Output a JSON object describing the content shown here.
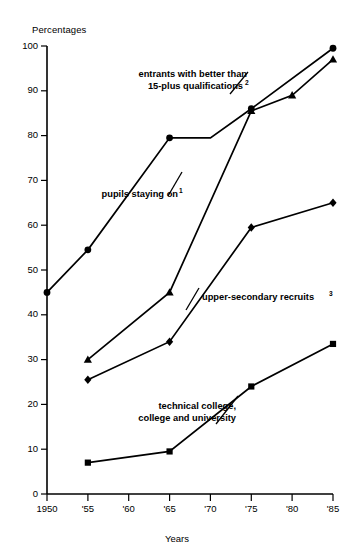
{
  "chart_data": {
    "type": "line",
    "title": "",
    "ylabel": "Percentages",
    "xlabel": "Years",
    "ylim": [
      0,
      100
    ],
    "xlim": [
      1950,
      1985
    ],
    "grid": false,
    "legend_position": "inline-annotations",
    "y_ticks": [
      0,
      10,
      20,
      30,
      40,
      50,
      60,
      70,
      80,
      90,
      100
    ],
    "y_tick_labels": [
      "0",
      "10",
      "20",
      "30",
      "40",
      "50",
      "60",
      "70",
      "80",
      "90",
      "100"
    ],
    "x_ticks": [
      1950,
      1955,
      1960,
      1965,
      1970,
      1975,
      1980,
      1985
    ],
    "x_tick_labels": [
      "1950",
      "'55",
      "'60",
      "'65",
      "'70",
      "'75",
      "'80",
      "'85"
    ],
    "series": [
      {
        "name": "pupils staying on",
        "footnote": "1",
        "marker": "circle",
        "x": [
          1950,
          1955,
          1965,
          1970,
          1975,
          1985
        ],
        "values": [
          45,
          54.5,
          79.5,
          79.5,
          86,
          99.5
        ]
      },
      {
        "name": "entrants with better than 15-plus qualifications",
        "footnote": "2",
        "marker": "triangle",
        "x": [
          1955,
          1965,
          1975,
          1980,
          1985
        ],
        "values": [
          30,
          45,
          85.5,
          89,
          97
        ]
      },
      {
        "name": "upper-secondary recruits",
        "footnote": "3",
        "marker": "diamond",
        "x": [
          1955,
          1965,
          1975,
          1985
        ],
        "values": [
          25.5,
          34,
          59.5,
          65
        ]
      },
      {
        "name": "technical college, college and university",
        "footnote": "",
        "marker": "square",
        "x": [
          1955,
          1965,
          1975,
          1985
        ],
        "values": [
          7,
          9.5,
          24,
          33.5
        ]
      }
    ],
    "annotations": [
      {
        "id": "annotation-entrants",
        "lines": [
          "entrants with better than",
          "15-plus qualifications"
        ],
        "footnote": "2"
      },
      {
        "id": "annotation-pupils",
        "lines": [
          "pupils staying on"
        ],
        "footnote": "1"
      },
      {
        "id": "annotation-upper-secondary",
        "lines": [
          "upper-secondary recruits"
        ],
        "footnote": "3"
      },
      {
        "id": "annotation-technical-college",
        "lines": [
          "technical college,",
          "college and university"
        ],
        "footnote": ""
      }
    ]
  }
}
